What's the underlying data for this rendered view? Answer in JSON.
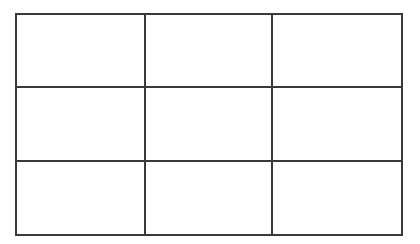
{
  "grid": {
    "rows": 3,
    "cols": 3,
    "line_color": "#3a3a3a",
    "background": "#ffffff",
    "cells": [
      [
        "",
        "",
        ""
      ],
      [
        "",
        "",
        ""
      ],
      [
        "",
        "",
        ""
      ]
    ]
  }
}
